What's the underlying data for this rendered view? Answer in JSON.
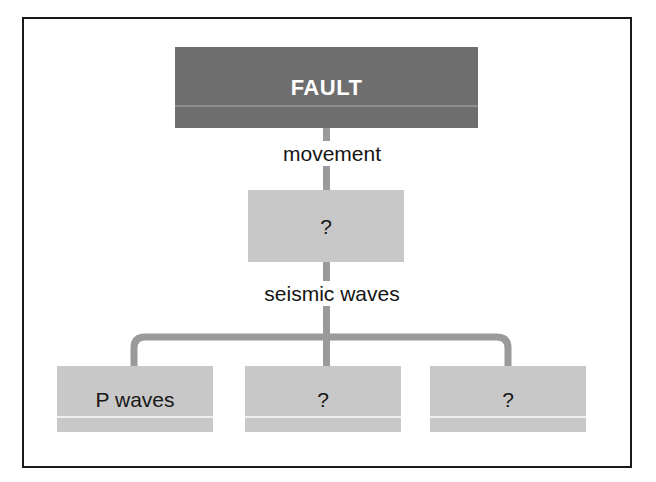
{
  "diagram": {
    "colors": {
      "root_fill": "#6e6e6e",
      "node_fill": "#c8c8c8",
      "connector": "#9a9a9a",
      "frame": "#1a1a1a",
      "root_text": "#ffffff",
      "node_text": "#171717",
      "rule_light": "#efefef",
      "rule_dark": "#8d8d8d",
      "background": "#ffffff"
    },
    "nodes": {
      "root": {
        "label": "FAULT"
      },
      "middle": {
        "label": "?"
      },
      "leaf_left": {
        "label": "P waves"
      },
      "leaf_center": {
        "label": "?"
      },
      "leaf_right": {
        "label": "?"
      }
    },
    "edges": {
      "root_to_middle": {
        "label": "movement"
      },
      "middle_to_leaves": {
        "label": "seismic waves"
      }
    }
  }
}
